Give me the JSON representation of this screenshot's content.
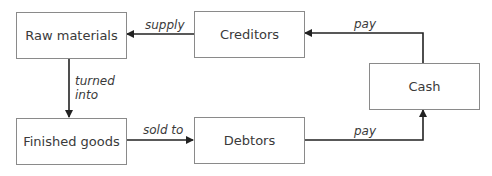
{
  "nodes": {
    "raw_materials": "Raw materials",
    "creditors": "Creditors",
    "cash": "Cash",
    "finished_goods": "Finished goods",
    "debtors": "Debtors"
  },
  "edges": {
    "supply": "supply",
    "pay_top": "pay",
    "turned_into_1": "turned",
    "turned_into_2": "into",
    "sold_to": "sold to",
    "pay_bottom": "pay"
  },
  "colors": {
    "line": "#222222",
    "box_border": "#8a8a8a",
    "text": "#3a3a3a"
  }
}
